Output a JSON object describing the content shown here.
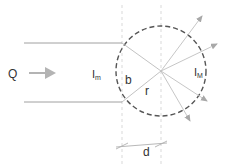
{
  "diagram": {
    "labels": {
      "flow": "Q",
      "inlet_intensity": "I",
      "inlet_sub": "m",
      "outlet_intensity": "I",
      "outlet_sub": "M",
      "chord": "b",
      "radius": "r",
      "distance": "d"
    },
    "colors": {
      "line": "#aaaaaa",
      "circle": "#555555",
      "arrow": "#b4b4b4",
      "text": "#333333"
    }
  }
}
